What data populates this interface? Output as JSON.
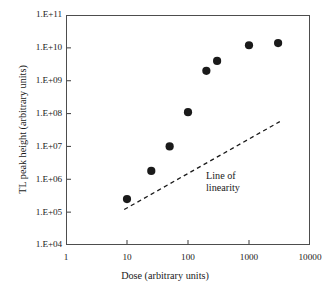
{
  "chart_data": {
    "type": "scatter",
    "title": "",
    "xlabel": "Dose (arbitrary units)",
    "ylabel": "TL peak height (arbitrary units)",
    "xscale": "log",
    "yscale": "log",
    "xlim": [
      1,
      10000
    ],
    "ylim": [
      10000,
      100000000000
    ],
    "grid": false,
    "legend": null,
    "xticks": [
      {
        "value": 1,
        "label": "1"
      },
      {
        "value": 10,
        "label": "10"
      },
      {
        "value": 100,
        "label": "100"
      },
      {
        "value": 1000,
        "label": "1000"
      },
      {
        "value": 10000,
        "label": "10000"
      }
    ],
    "yticks": [
      {
        "value": 100000000000,
        "label": "1.E+11"
      },
      {
        "value": 10000000000,
        "label": "1.E+10"
      },
      {
        "value": 1000000000,
        "label": "1.E+09"
      },
      {
        "value": 100000000,
        "label": "1.E+08"
      },
      {
        "value": 10000000,
        "label": "1.E+07"
      },
      {
        "value": 1000000,
        "label": "1.E+06"
      },
      {
        "value": 100000,
        "label": "1.E+05"
      },
      {
        "value": 10000,
        "label": "1.E+04"
      }
    ],
    "series": [
      {
        "name": "TL peak height",
        "marker": "filled-circle",
        "color": "#1a1a1a",
        "points": [
          {
            "x": 10,
            "y": 250000
          },
          {
            "x": 25,
            "y": 1800000
          },
          {
            "x": 50,
            "y": 10000000
          },
          {
            "x": 100,
            "y": 110000000
          },
          {
            "x": 200,
            "y": 2000000000
          },
          {
            "x": 300,
            "y": 4000000000
          },
          {
            "x": 1000,
            "y": 12000000000
          },
          {
            "x": 3000,
            "y": 14000000000
          }
        ]
      }
    ],
    "annotations": [
      {
        "name": "line-of-linearity",
        "text_lines": [
          "Line of",
          "linearity"
        ],
        "style": "dashed",
        "color": "#1a1a1a",
        "line_start": {
          "x": 9,
          "y": 120000
        },
        "line_end": {
          "x": 3200,
          "y": 57000000
        }
      }
    ]
  }
}
